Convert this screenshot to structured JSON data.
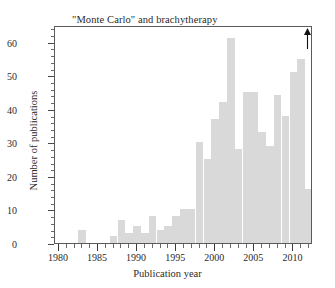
{
  "chart_data": {
    "type": "bar",
    "title": "\"Monte Carlo\" and brachytherapy",
    "xlabel": "Publication year",
    "ylabel": "Number of publications",
    "xlim": [
      1979.5,
      2012.5
    ],
    "ylim": [
      0,
      65
    ],
    "grid": false,
    "legend": null,
    "x_ticks_major": [
      1980,
      1985,
      1990,
      1995,
      2000,
      2005,
      2010
    ],
    "x_tick_labels": [
      "1980",
      "1985",
      "1990",
      "1995",
      "2000",
      "2005",
      "2010"
    ],
    "x_tick_minor_step": 1,
    "y_ticks_major": [
      0,
      10,
      20,
      30,
      40,
      50,
      60
    ],
    "y_tick_labels": [
      "0",
      "10",
      "20",
      "30",
      "40",
      "50",
      "60"
    ],
    "y_tick_minor_step": 2,
    "bar_color": "#d9d9d9",
    "frame_color": "#5a5a5a",
    "categories": [
      1980,
      1981,
      1982,
      1983,
      1984,
      1985,
      1986,
      1987,
      1988,
      1989,
      1990,
      1991,
      1992,
      1993,
      1994,
      1995,
      1996,
      1997,
      1998,
      1999,
      2000,
      2001,
      2002,
      2003,
      2004,
      2005,
      2006,
      2007,
      2008,
      2009,
      2010,
      2011,
      2012
    ],
    "values": [
      0,
      0,
      0,
      4,
      0,
      0,
      0,
      2,
      7,
      3,
      5,
      3,
      8,
      4,
      5,
      8,
      10,
      10,
      30,
      25,
      37,
      42,
      61,
      28,
      45,
      45,
      33,
      29,
      44,
      38,
      51,
      55,
      16
    ],
    "annotations": [
      {
        "name": "arrow-up",
        "x": 2012,
        "y": 62,
        "symbol": "↑",
        "note": "upward arrow at top right"
      }
    ]
  }
}
